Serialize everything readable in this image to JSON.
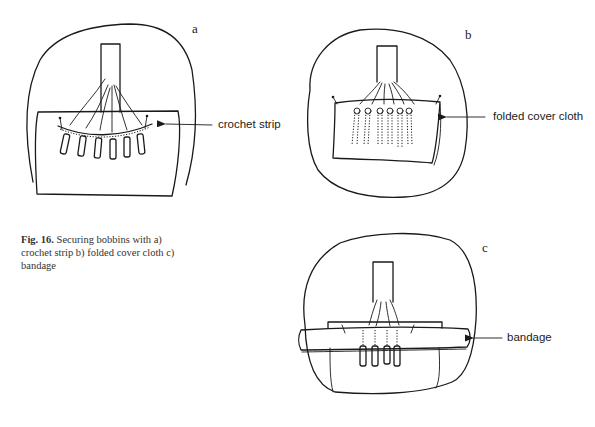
{
  "figure": {
    "number_label": "Fig. 16.",
    "caption_text": "Securing bobbins with a) crochet strip b) folded cover cloth c) bandage"
  },
  "panels": [
    {
      "letter": "a",
      "label": "crochet strip",
      "method": "crochet strip",
      "bobbin_count": 6
    },
    {
      "letter": "b",
      "label": "folded cover cloth",
      "method": "folded cover cloth",
      "bobbin_count": 6
    },
    {
      "letter": "c",
      "label": "bandage",
      "method": "bandage",
      "bobbin_count": 4
    }
  ],
  "colors": {
    "ink": "#1a1a1a",
    "background": "#ffffff"
  }
}
